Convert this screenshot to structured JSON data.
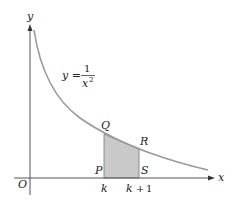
{
  "figure": {
    "axes": {
      "x_label": "x",
      "y_label": "y",
      "origin_label": "O"
    },
    "equation": {
      "lhs": "y =",
      "numerator": "1",
      "denominator": "x",
      "exponent": "2"
    },
    "points": {
      "P": "P",
      "Q": "Q",
      "R": "R",
      "S": "S"
    },
    "ticks": {
      "k": "k",
      "k_plus_1_var": "k",
      "k_plus_1_op": "+",
      "k_plus_1_num": "1"
    },
    "colors": {
      "axis": "#555555",
      "curve": "#9a9a9a",
      "shade": "#c9c9c9",
      "text": "#222222"
    }
  }
}
